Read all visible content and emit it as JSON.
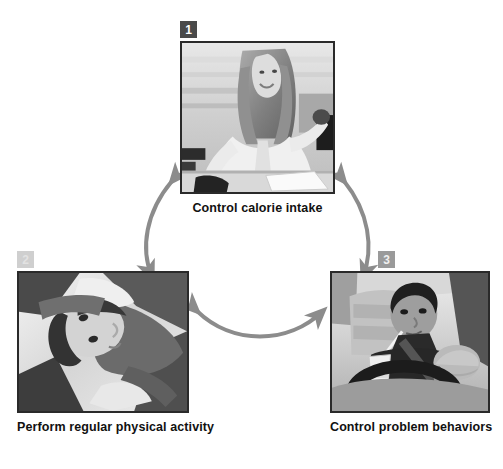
{
  "figure": {
    "type": "cycle-diagram",
    "node_count": 3,
    "arrow_color": "#8c8c8c",
    "frame_color": "#2a2a2a",
    "background": "#ffffff",
    "corner_mark": ""
  },
  "nodes": [
    {
      "number": "1",
      "badge_style": "dark",
      "caption": "Control calorie intake",
      "image_alt": "Woman seated at a desk holding food in one hand while working"
    },
    {
      "number": "2",
      "badge_style": "light",
      "caption": "Perform regular physical activity",
      "image_alt": "Person performing a stretching exercise on the floor"
    },
    {
      "number": "3",
      "badge_style": "mid",
      "caption": "Control problem behaviors",
      "image_alt": "Person eating a sandwich and drinking while sitting in a car"
    }
  ],
  "arrows": [
    {
      "name": "arrow-node1-node2",
      "style": "double-headed-curved",
      "from": "1",
      "to": "2"
    },
    {
      "name": "arrow-node1-node3",
      "style": "double-headed-curved",
      "from": "1",
      "to": "3"
    },
    {
      "name": "arrow-node2-node3",
      "style": "double-headed-curved",
      "from": "2",
      "to": "3"
    }
  ]
}
